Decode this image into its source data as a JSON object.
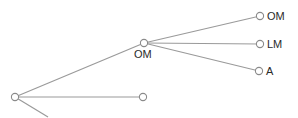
{
  "diagram": {
    "type": "tree",
    "colors": {
      "edge": "#9a9a9a",
      "node_stroke": "#8a8a8a",
      "node_fill": "#ffffff",
      "label": "#2a2a2a",
      "background": "#ffffff"
    },
    "nodes": [
      {
        "id": "root",
        "label": "",
        "x": 15,
        "y": 97
      },
      {
        "id": "mid",
        "label": "OM",
        "x": 144,
        "y": 43,
        "label_x": 134,
        "label_y": 58
      },
      {
        "id": "bottom",
        "label": "",
        "x": 143,
        "y": 97
      },
      {
        "id": "leaf_om",
        "label": "OM",
        "x": 260,
        "y": 16,
        "label_x": 267,
        "label_y": 20
      },
      {
        "id": "leaf_lm",
        "label": "LM",
        "x": 260,
        "y": 44,
        "label_x": 267,
        "label_y": 48
      },
      {
        "id": "leaf_a",
        "label": "A",
        "x": 259,
        "y": 71,
        "label_x": 266,
        "label_y": 75
      }
    ],
    "edges": [
      {
        "from": "root",
        "to": "mid"
      },
      {
        "from": "root",
        "to": "bottom"
      },
      {
        "from": "root",
        "to": "offscreen",
        "x2": 48,
        "y2": 117
      },
      {
        "from": "mid",
        "to": "leaf_om"
      },
      {
        "from": "mid",
        "to": "leaf_lm"
      },
      {
        "from": "mid",
        "to": "leaf_a"
      }
    ]
  }
}
